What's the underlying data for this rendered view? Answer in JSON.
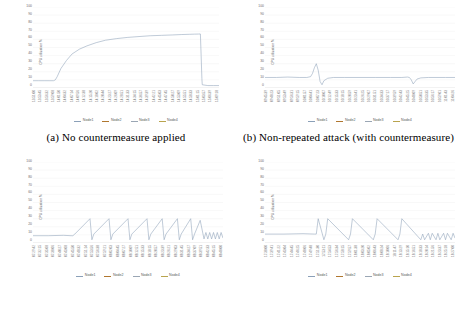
{
  "figure": {
    "panels": [
      {
        "id": "a",
        "caption": "(a) No countermeasure applied"
      },
      {
        "id": "b",
        "caption": "(b) Non-repeated attack (with countermeasure)"
      },
      {
        "id": "c",
        "caption": ""
      },
      {
        "id": "d",
        "caption": ""
      }
    ]
  },
  "legend": {
    "series": [
      "Node1",
      "Node2",
      "Node3",
      "Node4"
    ],
    "colors": [
      "#8ba0b8",
      "#b0772f",
      "#9aa6b4",
      "#b9a44e"
    ],
    "position": "bottom"
  },
  "axis": {
    "ylabel": "CPU utilization %",
    "yticks": [
      "100",
      "90",
      "80",
      "70",
      "60",
      "50",
      "40",
      "30",
      "20",
      "10",
      "0"
    ],
    "ylim": [
      0,
      100
    ],
    "grid": true
  },
  "chart_data": [
    {
      "type": "line",
      "panel": "a",
      "title": "",
      "xlabel": "",
      "ylabel": "CPU utilization %",
      "ylim": [
        0,
        100
      ],
      "grid": true,
      "legend": [
        "Node1",
        "Node2",
        "Node3",
        "Node4"
      ],
      "xtick_labels": [
        "13:51:00",
        "13:53:45",
        "13:56:32",
        "13:59:08",
        "14:01:50",
        "14:04:32",
        "14:07:14",
        "14:09:56",
        "14:12:38",
        "14:15:20",
        "14:18:02",
        "14:20:44",
        "14:23:27",
        "14:26:09",
        "14:28:51",
        "14:31:33",
        "14:34:15",
        "14:36:57",
        "14:39:39",
        "14:42:21",
        "14:45:03",
        "14:47:45",
        "14:50:27",
        "14:53:09",
        "14:55:51",
        "14:58:33",
        "15:01:15",
        "15:03:57",
        "15:06:39",
        "15:09:18"
      ],
      "series": [
        {
          "name": "Node1",
          "x": [
            0,
            3,
            6,
            9,
            11,
            12,
            13,
            15,
            18,
            21,
            25,
            29,
            34,
            39,
            45,
            51,
            57,
            63,
            69,
            75,
            80,
            84,
            87,
            89,
            90,
            90.4,
            90.8,
            91,
            94,
            97,
            100
          ],
          "values": [
            9,
            9,
            9,
            9,
            9,
            10,
            14,
            24,
            34,
            42,
            48,
            52,
            56,
            59,
            61,
            62.5,
            63.5,
            64.5,
            65,
            65.5,
            66,
            66.3,
            66.5,
            66.6,
            66.7,
            40,
            12,
            4,
            3,
            3,
            3
          ]
        }
      ]
    },
    {
      "type": "line",
      "panel": "b",
      "title": "",
      "xlabel": "",
      "ylabel": "CPU utilization %",
      "ylim": [
        0,
        100
      ],
      "grid": true,
      "legend": [
        "Node1",
        "Node2",
        "Node3",
        "Node4"
      ],
      "xtick_labels": [
        "09:45:39",
        "09:48:23",
        "09:51:05",
        "09:53:49",
        "09:56:31",
        "09:59:15",
        "10:01:57",
        "10:04:41",
        "10:07:23",
        "10:10:07",
        "10:12:49",
        "10:15:33",
        "10:18:15",
        "10:20:59",
        "10:23:41",
        "10:26:25",
        "10:29:07",
        "10:31:51",
        "10:34:33",
        "10:37:17",
        "10:39:59",
        "10:42:43",
        "10:45:25",
        "10:48:09",
        "10:50:51",
        "10:53:35",
        "10:56:17",
        "10:59:01",
        "11:01:43",
        "11:04:26"
      ],
      "series": [
        {
          "name": "Node1",
          "x": [
            0,
            6,
            12,
            18,
            22,
            24,
            25,
            26,
            27,
            28,
            29,
            30,
            31,
            33,
            36,
            42,
            50,
            58,
            66,
            72,
            75,
            76,
            77,
            78,
            79,
            80,
            82,
            86,
            90,
            95,
            100
          ],
          "values": [
            13,
            13,
            13.5,
            13,
            13,
            14,
            18,
            25,
            30,
            22,
            8,
            4,
            9,
            12,
            13,
            13,
            13,
            13,
            13,
            13,
            13.5,
            13,
            10,
            5,
            8,
            11,
            12.5,
            13,
            13,
            13,
            13
          ]
        }
      ]
    },
    {
      "type": "line",
      "panel": "c",
      "title": "",
      "xlabel": "",
      "ylabel": "CPU utilization %",
      "ylim": [
        0,
        100
      ],
      "grid": true,
      "legend": [
        "Node1",
        "Node2",
        "Node3",
        "Node4"
      ],
      "xtick_labels": [
        "07:29:42",
        "07:32:15",
        "07:35:08",
        "07:38:06",
        "07:40:27",
        "07:43:08",
        "07:45:50",
        "07:48:32",
        "07:51:14",
        "07:53:56",
        "07:56:38",
        "07:59:21",
        "08:02:03",
        "08:04:45",
        "08:07:27",
        "08:10:09",
        "08:12:51",
        "08:15:33",
        "08:18:15",
        "08:20:57",
        "08:23:39",
        "08:26:21",
        "08:29:03",
        "08:31:45",
        "08:34:27",
        "08:37:09",
        "08:39:51",
        "08:42:33",
        "08:45:15",
        "08:48:00"
      ],
      "series": [
        {
          "name": "Node1",
          "x": [
            0,
            8,
            16,
            20,
            21,
            22,
            30,
            31,
            32,
            40,
            41,
            42,
            50,
            51,
            52,
            60,
            61,
            62,
            68,
            69,
            70,
            76,
            77,
            78,
            83,
            84,
            85,
            88,
            90,
            91,
            92,
            93,
            94,
            95,
            96,
            97,
            98,
            99,
            100
          ],
          "values": [
            9,
            9,
            9.5,
            9,
            9,
            11,
            30,
            4,
            11,
            30,
            4,
            11,
            30,
            4,
            11,
            30,
            4,
            11,
            30,
            4,
            11,
            30,
            4,
            11,
            30,
            4,
            11,
            28,
            5,
            13,
            5,
            13,
            5,
            13,
            5,
            13,
            5,
            13,
            6
          ]
        }
      ]
    },
    {
      "type": "line",
      "panel": "d",
      "title": "",
      "xlabel": "",
      "ylabel": "CPU utilization %",
      "ylim": [
        0,
        100
      ],
      "grid": true,
      "legend": [
        "Node1",
        "Node2",
        "Node3",
        "Node4"
      ],
      "xtick_labels": [
        "17:38:00",
        "17:39:41",
        "17:41:22",
        "17:43:04",
        "17:44:45",
        "17:46:25",
        "17:48:06",
        "17:49:48",
        "17:51:30",
        "17:53:11",
        "17:54:53",
        "17:56:34",
        "17:58:15",
        "17:59:57",
        "18:01:38",
        "18:03:20",
        "18:05:02",
        "18:06:43",
        "18:08:24",
        "18:10:06",
        "18:11:47",
        "18:13:29",
        "18:15:10",
        "18:16:51",
        "18:18:33",
        "18:20:14",
        "18:21:56",
        "18:23:37",
        "18:25:18",
        "18:27:00"
      ],
      "series": [
        {
          "name": "Node1",
          "x": [
            0,
            10,
            20,
            26,
            27,
            28,
            31,
            32,
            33,
            44,
            45,
            46,
            57,
            58,
            59,
            70,
            71,
            72,
            82,
            83,
            84,
            86,
            87,
            88,
            90,
            91,
            92,
            94,
            95,
            96,
            98,
            99,
            100
          ],
          "values": [
            11,
            11,
            11.5,
            11,
            11,
            30,
            4,
            11,
            30,
            4,
            11,
            30,
            4,
            11,
            30,
            4,
            11,
            30,
            4,
            11,
            4,
            12,
            4,
            12,
            4,
            12,
            4,
            12,
            4,
            12,
            4,
            12,
            6
          ]
        }
      ]
    }
  ]
}
